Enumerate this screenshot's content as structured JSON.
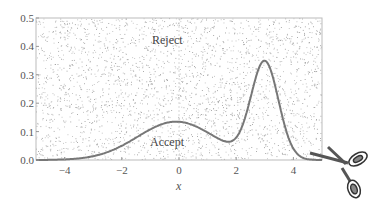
{
  "chart_data": {
    "type": "line",
    "title": "",
    "xlabel": "x",
    "ylabel": "",
    "xlim": [
      -5,
      5
    ],
    "ylim": [
      0,
      0.5
    ],
    "xticks": [
      "-4",
      "-2",
      "0",
      "2",
      "4"
    ],
    "yticks": [
      "0.0",
      "0.1",
      "0.2",
      "0.3",
      "0.4",
      "0.5"
    ],
    "grid": false,
    "series": [
      {
        "name": "density",
        "x": [
          -5,
          -4,
          -3,
          -2,
          -1,
          0,
          1,
          1.7,
          2.5,
          3,
          3.5,
          4,
          4.5,
          5
        ],
        "y": [
          0.0,
          0.003,
          0.018,
          0.06,
          0.11,
          0.135,
          0.115,
          0.09,
          0.28,
          0.42,
          0.28,
          0.06,
          0.005,
          0.0
        ]
      }
    ],
    "annotations": [
      {
        "text": "Reject",
        "x": -0.3,
        "y": 0.33
      },
      {
        "text": "Accept",
        "x": -0.3,
        "y": 0.03
      }
    ],
    "background": "uniform random scatter points (rejection sampling)",
    "icon": "scissors-icon"
  },
  "labels": {
    "reject": "Reject",
    "accept": "Accept",
    "xlabel": "x"
  }
}
